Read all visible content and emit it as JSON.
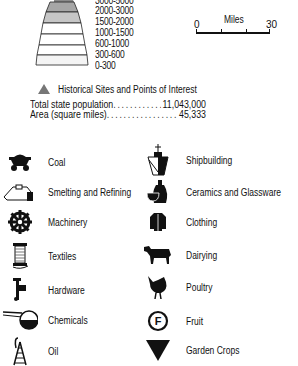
{
  "elevation_legend": {
    "bands": [
      {
        "label": "3000-5000",
        "fill": "#8a8a8a"
      },
      {
        "label": "2000-3000",
        "fill": "#a6a6a6"
      },
      {
        "label": "1500-2000",
        "fill": "#c6c6c6"
      },
      {
        "label": "1000-1500",
        "fill": "#ffffff"
      },
      {
        "label": "600-1000",
        "fill": "#ffffff"
      },
      {
        "label": "300-600",
        "fill": "#ffffff"
      },
      {
        "label": "0-300",
        "fill": "#f4f4f4"
      }
    ]
  },
  "scale_bar": {
    "title": "Miles",
    "min": "0",
    "max": "30"
  },
  "historical": {
    "label": "Historical Sites and Points of Interest",
    "color": "#777777"
  },
  "stats": [
    {
      "label": "Total state population",
      "value": "11,043,000"
    },
    {
      "label": "Area (square miles)",
      "value": "45,333"
    }
  ],
  "industries_left": [
    {
      "icon": "coal-cart-icon",
      "label": "Coal"
    },
    {
      "icon": "smelting-furnace-icon",
      "label": "Smelting and Refining"
    },
    {
      "icon": "gear-icon",
      "label": "Machinery"
    },
    {
      "icon": "spool-icon",
      "label": "Textiles"
    },
    {
      "icon": "hardware-tool-icon",
      "label": "Hardware"
    },
    {
      "icon": "retort-flask-icon",
      "label": "Chemicals"
    },
    {
      "icon": "oil-derrick-icon",
      "label": "Oil"
    }
  ],
  "industries_right": [
    {
      "icon": "ship-icon",
      "label": "Shipbuilding"
    },
    {
      "icon": "vase-bowl-icon",
      "label": "Ceramics and Glassware"
    },
    {
      "icon": "coat-icon",
      "label": "Clothing"
    },
    {
      "icon": "cow-icon",
      "label": "Dairying"
    },
    {
      "icon": "chicken-icon",
      "label": "Poultry"
    },
    {
      "icon": "fruit-f-icon",
      "label": "Fruit"
    },
    {
      "icon": "inverted-triangle-icon",
      "label": "Garden Crops"
    }
  ]
}
